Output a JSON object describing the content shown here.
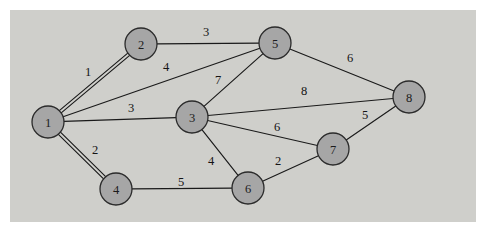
{
  "figure": {
    "kind": "undirected-weighted-graph-diagram",
    "width": 486,
    "height": 233,
    "background_color": "#ffffff",
    "canvas_color": "#cfcfcb",
    "canvas_rect": {
      "x": 10,
      "y": 10,
      "width": 466,
      "height": 212
    },
    "node_fill_color": "#a6a6a6",
    "node_stroke_color": "#2b2b2b",
    "edge_color": "#1a1a1a",
    "label_color": "#141414"
  },
  "chart_data": {
    "type": "diagram",
    "title": "",
    "xlabel": "",
    "ylabel": "",
    "nodes": [
      {
        "id": "1",
        "label": "1",
        "x": 48,
        "y": 122,
        "r": 16
      },
      {
        "id": "2",
        "label": "2",
        "x": 141,
        "y": 44,
        "r": 16
      },
      {
        "id": "3",
        "label": "3",
        "x": 192,
        "y": 117,
        "r": 16
      },
      {
        "id": "4",
        "label": "4",
        "x": 116,
        "y": 189,
        "r": 16
      },
      {
        "id": "5",
        "label": "5",
        "x": 275,
        "y": 43,
        "r": 16
      },
      {
        "id": "6",
        "label": "6",
        "x": 248,
        "y": 188,
        "r": 16
      },
      {
        "id": "7",
        "label": "7",
        "x": 333,
        "y": 149,
        "r": 16
      },
      {
        "id": "8",
        "label": "8",
        "x": 409,
        "y": 97,
        "r": 16
      }
    ],
    "edges": [
      {
        "source": "1",
        "target": "2",
        "weight": "1",
        "label_x": 88,
        "label_y": 72,
        "double": true
      },
      {
        "source": "1",
        "target": "5",
        "weight": "4",
        "label_x": 166,
        "label_y": 67,
        "double": false
      },
      {
        "source": "1",
        "target": "3",
        "weight": "3",
        "label_x": 131,
        "label_y": 108,
        "double": false
      },
      {
        "source": "1",
        "target": "4",
        "weight": "2",
        "label_x": 95,
        "label_y": 150,
        "double": true
      },
      {
        "source": "2",
        "target": "5",
        "weight": "3",
        "label_x": 206,
        "label_y": 32,
        "double": false
      },
      {
        "source": "3",
        "target": "5",
        "weight": "7",
        "label_x": 218,
        "label_y": 80,
        "double": false
      },
      {
        "source": "3",
        "target": "8",
        "weight": "8",
        "label_x": 304,
        "label_y": 91,
        "double": false
      },
      {
        "source": "3",
        "target": "6",
        "weight": "4",
        "label_x": 211,
        "label_y": 161,
        "double": false
      },
      {
        "source": "3",
        "target": "7",
        "weight": "6",
        "label_x": 277,
        "label_y": 127,
        "double": false
      },
      {
        "source": "5",
        "target": "8",
        "weight": "6",
        "label_x": 350,
        "label_y": 58,
        "double": false
      },
      {
        "source": "6",
        "target": "7",
        "weight": "2",
        "label_x": 278,
        "label_y": 161,
        "double": false
      },
      {
        "source": "4",
        "target": "6",
        "weight": "5",
        "label_x": 181,
        "label_y": 182,
        "double": false
      },
      {
        "source": "7",
        "target": "8",
        "weight": "5",
        "label_x": 365,
        "label_y": 115,
        "double": false
      }
    ]
  }
}
